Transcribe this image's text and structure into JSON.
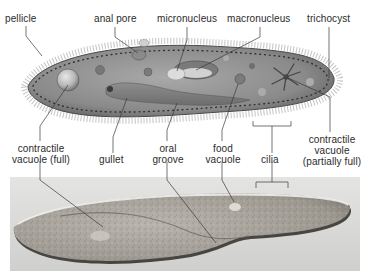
{
  "figure": {
    "panels": [
      {
        "id": "illustration",
        "description": "Labeled illustration of a paramecium"
      },
      {
        "id": "micrograph",
        "description": "Light micrograph of a paramecium"
      }
    ]
  },
  "labels": {
    "pellicle": "pellicle",
    "anal_pore": "anal pore",
    "micronucleus": "micronucleus",
    "macronucleus": "macronucleus",
    "trichocyst": "trichocyst",
    "contractile_vacuole_full_1": "contractile",
    "contractile_vacuole_full_2": "vacuole (full)",
    "gullet": "gullet",
    "oral_groove_1": "oral",
    "oral_groove_2": "groove",
    "food_vacuole_1": "food",
    "food_vacuole_2": "vacuole",
    "cilia": "cilia",
    "contractile_vacuole_partial_1": "contractile",
    "contractile_vacuole_partial_2": "vacuole",
    "contractile_vacuole_partial_3": "(partially full)"
  },
  "colors": {
    "label_text": "#2b2b2b",
    "leader_line": "#3a3a3a",
    "cell_body": "#8c8c8c",
    "cell_edge": "#4a4a4a",
    "photo_bg": "#d6d6d6",
    "photo_cell": "#a8a49e"
  }
}
